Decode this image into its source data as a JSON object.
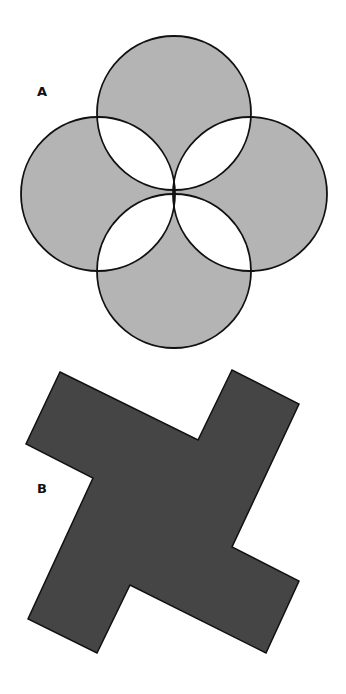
{
  "figures": [
    {
      "label": "A",
      "description": "Four overlapping circles arranged in a cross; non-overlapping regions shaded gray, overlap lenses white",
      "circles": [
        {
          "cx": 174,
          "cy": 113,
          "r": 77
        },
        {
          "cx": 98,
          "cy": 194,
          "r": 77
        },
        {
          "cx": 250,
          "cy": 194,
          "r": 77
        },
        {
          "cx": 174,
          "cy": 271,
          "r": 77
        }
      ],
      "fill_color": "#b4b4b4",
      "overlap_color": "#ffffff",
      "stroke_color": "#111111"
    },
    {
      "label": "B",
      "description": "Tilted cross (plus) shape with four arms, filled dark gray",
      "points": "60,372 198,440 232,370 299,404 232,547 299,581 266,653 130,585 97,653 28,619 93,478 26,444",
      "fill_color": "#454545",
      "stroke_color": "#111111"
    }
  ]
}
